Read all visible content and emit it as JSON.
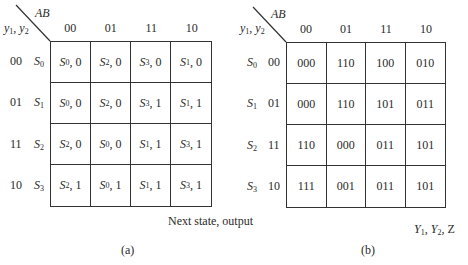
{
  "tables": [
    {
      "id": "a",
      "corner": {
        "col_var": "AB",
        "row_var": "y1, y2"
      },
      "columns": [
        "00",
        "01",
        "11",
        "10"
      ],
      "rows": [
        {
          "code": "00",
          "state": "S0",
          "cells": [
            "S0, 0",
            "S2, 0",
            "S3, 0",
            "S1, 0"
          ]
        },
        {
          "code": "01",
          "state": "S1",
          "cells": [
            "S0, 0",
            "S2, 0",
            "S3, 1",
            "S1, 1"
          ]
        },
        {
          "code": "11",
          "state": "S2",
          "cells": [
            "S2, 0",
            "S0, 0",
            "S1, 1",
            "S3, 1"
          ]
        },
        {
          "code": "10",
          "state": "S3",
          "cells": [
            "S2, 1",
            "S0, 1",
            "S1, 1",
            "S3, 1"
          ]
        }
      ],
      "footer": "Next state, output",
      "caption": "(a)"
    },
    {
      "id": "b",
      "corner": {
        "col_var": "AB",
        "row_var": "y1, y2"
      },
      "columns": [
        "00",
        "01",
        "11",
        "10"
      ],
      "rows": [
        {
          "code": "00",
          "state": "S0",
          "cells": [
            "000",
            "110",
            "100",
            "010"
          ]
        },
        {
          "code": "01",
          "state": "S1",
          "cells": [
            "000",
            "110",
            "101",
            "011"
          ]
        },
        {
          "code": "11",
          "state": "S2",
          "cells": [
            "110",
            "000",
            "011",
            "101"
          ]
        },
        {
          "code": "10",
          "state": "S3",
          "cells": [
            "111",
            "001",
            "011",
            "101"
          ]
        }
      ],
      "footer": "Y1, Y2, Z",
      "caption": "(b)"
    }
  ]
}
